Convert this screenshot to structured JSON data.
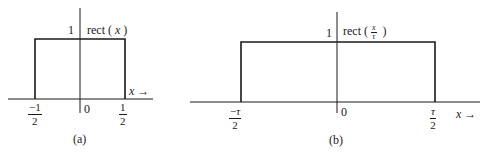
{
  "panels": [
    {
      "id": "a",
      "caption": "(a)",
      "function_label": {
        "name": "rect",
        "open": "(",
        "arg": "x",
        "close": ")"
      },
      "height_label": "1",
      "origin_label": "0",
      "axis_label": "x",
      "axis_arrow": "→",
      "left_tick": {
        "sign": "−",
        "num": "1",
        "den": "2"
      },
      "right_tick": {
        "num": "1",
        "den": "2"
      }
    },
    {
      "id": "b",
      "caption": "(b)",
      "function_label": {
        "name": "rect",
        "open": "(",
        "arg_num": "x",
        "arg_den": "τ",
        "close": ")"
      },
      "height_label": "1",
      "origin_label": "0",
      "axis_label": "x",
      "axis_arrow": "→",
      "left_tick": {
        "sign": "−",
        "num": "τ",
        "den": "2"
      },
      "right_tick": {
        "num": "τ",
        "den": "2"
      }
    }
  ],
  "colors": {
    "line": "#1a1a1a",
    "background": "#ffffff"
  }
}
